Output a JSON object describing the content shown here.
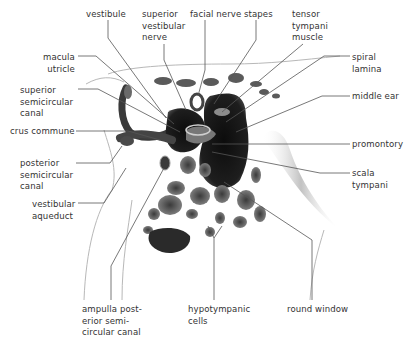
{
  "figure": {
    "colors": {
      "background": "#ffffff",
      "ink": "#1a1a1a",
      "leader": "#555555",
      "text": "#333333"
    }
  },
  "labels": [
    {
      "id": "vestibule",
      "text": "vestibule",
      "x": 86,
      "y": 8
    },
    {
      "id": "superior-vestibular-nerve",
      "text": "superior\nvestibular\nnerve",
      "x": 142,
      "y": 8
    },
    {
      "id": "facial-nerve",
      "text": "facial nerve",
      "x": 190,
      "y": 8
    },
    {
      "id": "stapes",
      "text": "stapes",
      "x": 244,
      "y": 8
    },
    {
      "id": "tensor-tympani-muscle",
      "text": "tensor\ntympani\nmuscle",
      "x": 292,
      "y": 8
    },
    {
      "id": "macula-utricle",
      "text": "macula\nutricle",
      "x": 43,
      "y": 51
    },
    {
      "id": "spiral-lamina",
      "text": "spiral\nlamina",
      "x": 352,
      "y": 51
    },
    {
      "id": "superior-semicircular-canal",
      "text": "superior\nsemicircular\ncanal",
      "x": 20,
      "y": 84
    },
    {
      "id": "middle-ear",
      "text": "middle ear",
      "x": 352,
      "y": 90
    },
    {
      "id": "crus-commune",
      "text": "crus commune",
      "x": 10,
      "y": 125
    },
    {
      "id": "promontory",
      "text": "promontory",
      "x": 352,
      "y": 138
    },
    {
      "id": "posterior-semicircular-canal",
      "text": "posterior\nsemicircular\ncanal",
      "x": 20,
      "y": 157
    },
    {
      "id": "scala-tympani",
      "text": "scala\ntympani",
      "x": 352,
      "y": 167
    },
    {
      "id": "vestibular-aqueduct",
      "text": "vestibular\naqueduct",
      "x": 32,
      "y": 198
    },
    {
      "id": "ampulla-posterior-semicircular-canal",
      "text": "ampulla post-\nerior semi-\ncircular canal",
      "x": 82,
      "y": 303
    },
    {
      "id": "hypotympanic-cells",
      "text": "hypotympanic\ncells",
      "x": 188,
      "y": 303
    },
    {
      "id": "round-window",
      "text": "round window",
      "x": 287,
      "y": 303
    }
  ]
}
